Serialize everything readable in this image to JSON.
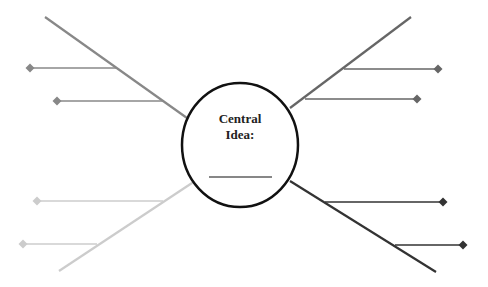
{
  "central": {
    "title_line1": "Central",
    "title_line2": "Idea:",
    "blank": "__________",
    "cx": 240,
    "cy": 145,
    "rx": 58,
    "ry": 62,
    "stroke": "#111111"
  },
  "spokes": [
    {
      "name": "top-left",
      "color": "#888888",
      "line": [
        45,
        17,
        187,
        118
      ],
      "branches": [
        {
          "y": 68,
          "x1": 30,
          "x2": 116
        },
        {
          "y": 101,
          "x1": 57,
          "x2": 163
        }
      ]
    },
    {
      "name": "top-right",
      "color": "#666666",
      "line": [
        411,
        17,
        290,
        108
      ],
      "branches": [
        {
          "y": 69,
          "x1": 344,
          "x2": 438
        },
        {
          "y": 99,
          "x1": 305,
          "x2": 417
        }
      ]
    },
    {
      "name": "bottom-left",
      "color": "#cccccc",
      "line": [
        59,
        271,
        195,
        181
      ],
      "branches": [
        {
          "y": 201,
          "x1": 37,
          "x2": 163
        },
        {
          "y": 244,
          "x1": 23,
          "x2": 97
        }
      ]
    },
    {
      "name": "bottom-right",
      "color": "#333333",
      "line": [
        290,
        181,
        436,
        272
      ],
      "branches": [
        {
          "y": 202,
          "x1": 325,
          "x2": 443
        },
        {
          "y": 245,
          "x1": 395,
          "x2": 463
        }
      ]
    }
  ]
}
